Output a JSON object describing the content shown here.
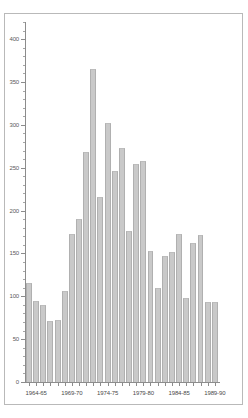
{
  "figure": {
    "background_color": "#ffffff",
    "frame_color": "#b9b9b9",
    "bar_color": "#c9c9c9",
    "bar_edge_color": "#b0b0b0",
    "axis_color": "#8c8c8c",
    "tick_label_color": "#5a5a5a"
  },
  "chart_data": {
    "type": "bar",
    "title": "",
    "subtitle": "",
    "xlabel": "",
    "ylabel": "",
    "ylim": [
      0,
      420
    ],
    "yticks": [
      0,
      50,
      100,
      150,
      200,
      250,
      300,
      350,
      400
    ],
    "ytick_labels": [
      "0",
      "50",
      "100",
      "150",
      "200",
      "250",
      "300",
      "350",
      "400"
    ],
    "yminor_step": 10,
    "grid": false,
    "legend": null,
    "xtick_labels": [
      "1964-65",
      "1969-70",
      "1974-75",
      "1979-80",
      "1984-85",
      "1989-90"
    ],
    "xtick_label_indices": [
      1,
      6,
      11,
      16,
      21,
      26
    ],
    "categories": [
      "1963-64",
      "1964-65",
      "1965-66",
      "1966-67",
      "1967-68",
      "1968-69",
      "1969-70",
      "1970-71",
      "1971-72",
      "1972-73",
      "1973-74",
      "1974-75",
      "1975-76",
      "1976-77",
      "1977-78",
      "1978-79",
      "1979-80",
      "1980-81",
      "1981-82",
      "1982-83",
      "1983-84",
      "1984-85",
      "1985-86",
      "1986-87",
      "1987-88",
      "1988-89",
      "1989-90"
    ],
    "values": [
      116,
      94,
      90,
      71,
      72,
      106,
      173,
      190,
      268,
      365,
      216,
      302,
      246,
      273,
      176,
      254,
      258,
      153,
      110,
      147,
      152,
      173,
      98,
      162,
      171,
      93,
      93
    ]
  }
}
